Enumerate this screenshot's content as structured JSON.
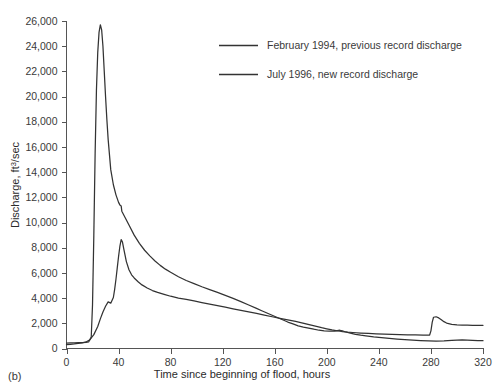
{
  "panel": {
    "label": "(b)"
  },
  "chart_data": {
    "type": "line",
    "title": "",
    "xlabel": "Time since beginning of flood, hours",
    "ylabel": "Discharge, ft3/sec",
    "ylabel_base": "Discharge, ft",
    "ylabel_sup": "3",
    "ylabel_tail": "/sec",
    "xlim": [
      0,
      320
    ],
    "ylim": [
      0,
      26000
    ],
    "grid": false,
    "legend_position": "top-right-inside",
    "xticks": [
      0,
      40,
      80,
      120,
      160,
      200,
      240,
      280,
      320
    ],
    "xtick_labels": [
      "0",
      "40",
      "80",
      "120",
      "160",
      "200",
      "240",
      "280",
      "320"
    ],
    "yticks": [
      0,
      2000,
      4000,
      6000,
      8000,
      10000,
      12000,
      14000,
      16000,
      18000,
      20000,
      22000,
      24000,
      26000
    ],
    "ytick_labels": [
      "0",
      "2,000",
      "4,000",
      "6,000",
      "8,000",
      "10,000",
      "12,000",
      "14,000",
      "16,000",
      "18,000",
      "20,000",
      "22,000",
      "24,000",
      "26,000"
    ],
    "series": [
      {
        "name": "February 1994, previous record discharge",
        "color": "#333333",
        "x": [
          0,
          3,
          6,
          9,
          12,
          15,
          18,
          21,
          24,
          26,
          28,
          30,
          32,
          34,
          36,
          37,
          38,
          39,
          40,
          41,
          42,
          43,
          44,
          46,
          48,
          50,
          52,
          55,
          58,
          62,
          66,
          70,
          75,
          80,
          86,
          92,
          98,
          104,
          110,
          116,
          122,
          128,
          134,
          140,
          146,
          152,
          158,
          164,
          170,
          176,
          180,
          184,
          188,
          192,
          196,
          200,
          204,
          208,
          210,
          212,
          216,
          220,
          226,
          232,
          238,
          244,
          250,
          256,
          262,
          268,
          274,
          279,
          280,
          281,
          282,
          284,
          286,
          288,
          290,
          292,
          296,
          300,
          304,
          308,
          312,
          316,
          320
        ],
        "y": [
          300,
          330,
          360,
          400,
          450,
          520,
          700,
          1100,
          1750,
          2350,
          2900,
          3350,
          3700,
          3600,
          4050,
          4700,
          5500,
          6400,
          7300,
          8100,
          8650,
          8450,
          7900,
          6900,
          6250,
          5850,
          5600,
          5300,
          5050,
          4800,
          4600,
          4450,
          4300,
          4150,
          4000,
          3900,
          3780,
          3650,
          3530,
          3400,
          3280,
          3150,
          3020,
          2900,
          2780,
          2650,
          2520,
          2400,
          2280,
          2150,
          2050,
          1950,
          1850,
          1750,
          1650,
          1560,
          1470,
          1400,
          1370,
          1340,
          1300,
          1270,
          1230,
          1200,
          1170,
          1150,
          1130,
          1110,
          1090,
          1080,
          1070,
          1070,
          1400,
          2100,
          2480,
          2520,
          2430,
          2280,
          2130,
          2020,
          1920,
          1880,
          1860,
          1850,
          1845,
          1840,
          1840
        ]
      },
      {
        "name": "July 1996, new record discharge",
        "color": "#333333",
        "x": [
          0,
          3,
          6,
          9,
          12,
          15,
          17,
          19,
          20,
          21,
          22,
          23,
          24,
          25,
          26,
          27,
          28,
          29,
          30,
          31,
          32,
          34,
          36,
          38,
          40,
          41,
          42,
          42.5,
          43,
          45,
          48,
          52,
          56,
          60,
          64,
          68,
          72,
          76,
          80,
          86,
          92,
          98,
          104,
          110,
          116,
          122,
          128,
          134,
          140,
          146,
          150,
          154,
          158,
          162,
          166,
          170,
          174,
          178,
          182,
          186,
          190,
          194,
          198,
          202,
          206,
          208,
          210,
          212,
          214,
          218,
          222,
          226,
          230,
          236,
          242,
          248,
          254,
          260,
          266,
          272,
          278,
          284,
          290,
          296,
          300,
          304,
          308,
          312,
          316,
          320
        ],
        "y": [
          430,
          440,
          450,
          460,
          470,
          490,
          520,
          900,
          3500,
          9000,
          15500,
          20500,
          23500,
          25100,
          25700,
          25300,
          24000,
          22000,
          20000,
          18200,
          16600,
          14200,
          13000,
          12200,
          11600,
          11400,
          11320,
          10900,
          10800,
          10400,
          9800,
          9000,
          8350,
          7800,
          7350,
          6950,
          6600,
          6300,
          6050,
          5700,
          5400,
          5150,
          4900,
          4680,
          4450,
          4220,
          3980,
          3720,
          3450,
          3180,
          3000,
          2820,
          2640,
          2460,
          2280,
          2100,
          1950,
          1800,
          1700,
          1620,
          1530,
          1450,
          1400,
          1370,
          1380,
          1420,
          1450,
          1400,
          1330,
          1220,
          1130,
          1060,
          1000,
          920,
          860,
          800,
          750,
          700,
          660,
          630,
          600,
          580,
          600,
          640,
          670,
          680,
          670,
          650,
          630,
          620
        ]
      }
    ],
    "annotations": []
  },
  "legend": {
    "entries": [
      {
        "label": "February 1994, previous record discharge"
      },
      {
        "label": "July 1996, new record discharge"
      }
    ]
  }
}
